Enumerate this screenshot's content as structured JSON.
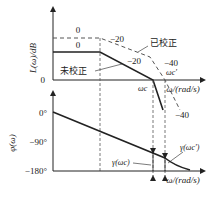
{
  "upper_plot": {
    "ylabel": "L(ω)/dB",
    "zero_tick": "0",
    "xlabel": "ω/(rad/s)",
    "slope_labels": {
      "uncorrected_flat": "0",
      "corrected_flat": "0",
      "corrected_mid": "−20",
      "uncorrected_mid": "−20",
      "corrected_high": "−40",
      "uncorrected_high": "−40"
    },
    "curve_labels": {
      "corrected": "已校正",
      "uncorrected": "未校正"
    },
    "crossover_labels": {
      "uncorrected": "ωc",
      "corrected": "ωc'"
    }
  },
  "lower_plot": {
    "ylabel": "φ(ω)",
    "ticks": [
      "0°",
      "−90°",
      "−180°"
    ],
    "xlabel": "ω/(rad/s)",
    "margin_labels": {
      "uncorrected": "γ(ωc)",
      "corrected": "γ(ωc')"
    }
  },
  "colors": {
    "line": "#222222",
    "dashed": "#555555",
    "background": "#ffffff"
  }
}
